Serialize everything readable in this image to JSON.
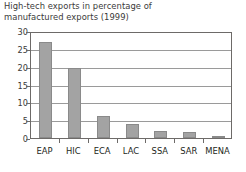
{
  "chart_data": {
    "type": "bar",
    "title": "High-tech exports in percentage of\nmanufactured exports (1999)",
    "xlabel": "",
    "ylabel": "",
    "categories": [
      "EAP",
      "HIC",
      "ECA",
      "LAC",
      "SSA",
      "SAR",
      "MENA"
    ],
    "values": [
      27,
      19.5,
      6.2,
      3.8,
      2.0,
      1.8,
      0.6
    ],
    "ylim": [
      0,
      30
    ],
    "yticks": [
      0,
      5,
      10,
      15,
      20,
      25,
      30
    ],
    "ytick_labels": [
      "0",
      "5",
      "10",
      "15",
      "20",
      "25",
      "30"
    ],
    "grid": true,
    "legend": false,
    "bar_color": "#a3a3a3",
    "bar_edge_color": "#8a8a8a",
    "axis_color": "#6d6a68",
    "grid_color": "#9a9a9a",
    "title_color": "#3a3a3a",
    "background": "#ffffff"
  }
}
